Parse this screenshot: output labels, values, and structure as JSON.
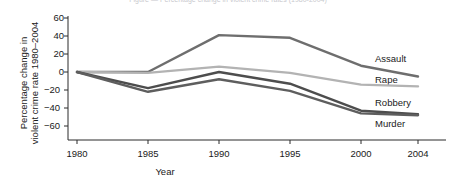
{
  "figure": {
    "clipped_title": "Figure — Percentage change in violent crime rates (1980-2004)"
  },
  "chart_data": {
    "type": "line",
    "title": "",
    "xlabel": "Year",
    "ylabel": "Percentage change in violent crime rate 1980–2004",
    "ylabel_line1": "Percentage change in",
    "ylabel_line2": "violent crime rate 1980–2004",
    "x": [
      1980,
      1985,
      1990,
      1995,
      2000,
      2004
    ],
    "categories": [
      "1980",
      "1985",
      "1990",
      "1995",
      "2000",
      "2004"
    ],
    "xlim": [
      1980,
      2004
    ],
    "ylim": [
      -70,
      62
    ],
    "yticks": [
      60,
      40,
      20,
      0,
      -20,
      -40,
      -60
    ],
    "ytick_labels": [
      "60",
      "40",
      "20",
      "0",
      "−20",
      "−40",
      "−60"
    ],
    "grid": false,
    "legend_position": "right-inline-labels",
    "series": [
      {
        "name": "Assault",
        "color": "#6e6e6e",
        "values": [
          0,
          0,
          41,
          38,
          7,
          -5
        ]
      },
      {
        "name": "Rape",
        "color": "#b3b3b3",
        "values": [
          0,
          -1,
          6,
          -1,
          -14,
          -16
        ]
      },
      {
        "name": "Robbery",
        "color": "#4d4d4d",
        "values": [
          0,
          -18,
          0,
          -13,
          -43,
          -47
        ]
      },
      {
        "name": "Murder",
        "color": "#5e5e5e",
        "values": [
          0,
          -22,
          -8,
          -21,
          -46,
          -48
        ]
      }
    ]
  }
}
